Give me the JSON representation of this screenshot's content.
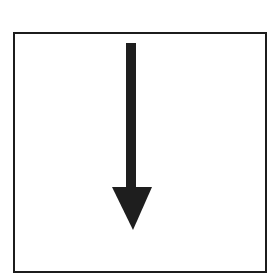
{
  "diagram": {
    "colors": {
      "background": "#ffffff",
      "frame_stroke": "#1c1c1c",
      "arrow_fill": "#1e1e1e"
    },
    "frame": {
      "x": 14,
      "y": 33,
      "width": 252,
      "height": 239,
      "stroke_width": 2
    },
    "arrow": {
      "direction": "down",
      "icon": "arrow-down-icon",
      "shaft": {
        "x": 126,
        "y": 43,
        "width": 10,
        "height": 146
      },
      "head": {
        "left_x": 112,
        "right_x": 152,
        "base_y": 187,
        "tip_x": 133,
        "tip_y": 230
      }
    }
  }
}
